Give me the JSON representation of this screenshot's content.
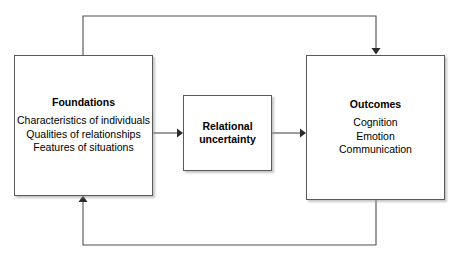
{
  "diagram": {
    "background_color": "#ffffff",
    "line_color": "#4f4f4f",
    "border_color": "#5a5a5a",
    "text_color": "#000000",
    "nodes": [
      {
        "id": "foundations",
        "title": "Foundations",
        "items": [
          "Characteristics of individuals",
          "Qualities of relationships",
          "Features of situations"
        ]
      },
      {
        "id": "relational_uncertainty",
        "title": "Relational\nuncertainty",
        "items": []
      },
      {
        "id": "outcomes",
        "title": "Outcomes",
        "items": [
          "Cognition",
          "Emotion",
          "Communication"
        ]
      }
    ],
    "edges": [
      {
        "id": "foundations-to-uncertainty",
        "from": "foundations",
        "to": "relational_uncertainty",
        "style": "straight-arrow"
      },
      {
        "id": "uncertainty-to-outcomes",
        "from": "relational_uncertainty",
        "to": "outcomes",
        "style": "straight-arrow"
      },
      {
        "id": "foundations-to-outcomes-top",
        "from": "foundations",
        "to": "outcomes",
        "style": "feedback-top-arrow"
      },
      {
        "id": "outcomes-to-foundations-bottom",
        "from": "outcomes",
        "to": "foundations",
        "style": "feedback-bottom-arrow"
      }
    ]
  }
}
